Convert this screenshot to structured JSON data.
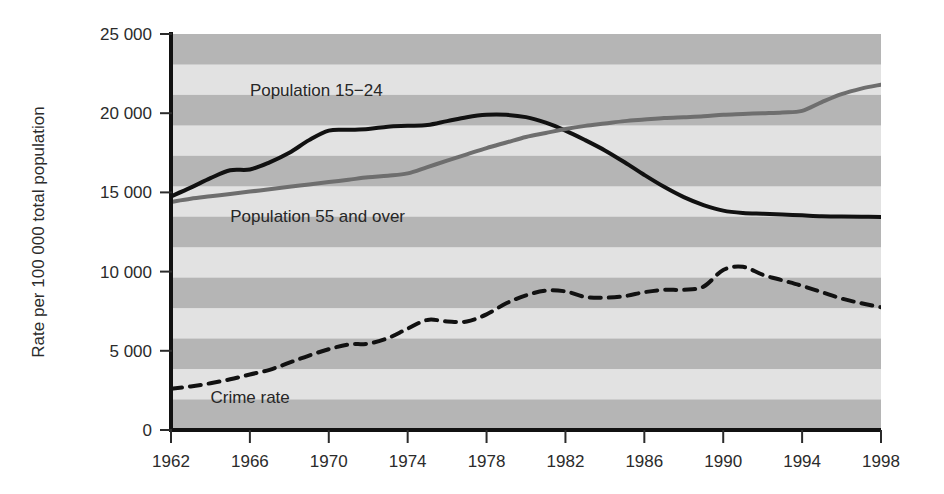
{
  "chart_data": {
    "type": "line",
    "title": "",
    "subtitle": "",
    "xlabel": "",
    "ylabel": "Rate per 100 000 total population",
    "xlim": [
      1962,
      1998
    ],
    "ylim": [
      0,
      25000
    ],
    "xticks": [
      1962,
      1966,
      1970,
      1974,
      1978,
      1982,
      1986,
      1990,
      1994,
      1998
    ],
    "xtick_labels": [
      "1962",
      "1966",
      "1970",
      "1974",
      "1978",
      "1982",
      "1986",
      "1990",
      "1994",
      "1998"
    ],
    "yticks": [
      0,
      5000,
      10000,
      15000,
      20000,
      25000
    ],
    "ytick_labels": [
      "0",
      "5 000",
      "10 000",
      "15 000",
      "20 000",
      "25 000"
    ],
    "grid": false,
    "banded_background": true,
    "band_colors": [
      "#b5b5b5",
      "#e2e2e2"
    ],
    "band_count": 13,
    "legend_position": "inline-annotations",
    "x": [
      1962,
      1963,
      1964,
      1965,
      1966,
      1967,
      1968,
      1969,
      1970,
      1971,
      1972,
      1973,
      1974,
      1975,
      1976,
      1977,
      1978,
      1979,
      1980,
      1981,
      1982,
      1983,
      1984,
      1985,
      1986,
      1987,
      1988,
      1989,
      1990,
      1991,
      1992,
      1993,
      1994,
      1995,
      1996,
      1997,
      1998
    ],
    "series": [
      {
        "name": "Population 15-24",
        "label": "Population 15−24",
        "color": "#111111",
        "style": "solid",
        "width": 4,
        "annotation_x": 1966,
        "annotation_y": 21100,
        "values": [
          14750,
          15300,
          15900,
          16400,
          16450,
          16900,
          17500,
          18300,
          18900,
          18950,
          19000,
          19150,
          19200,
          19250,
          19500,
          19750,
          19900,
          19900,
          19750,
          19400,
          18900,
          18300,
          17650,
          16900,
          16100,
          15350,
          14700,
          14200,
          13850,
          13700,
          13650,
          13600,
          13550,
          13500,
          13480,
          13460,
          13450
        ]
      },
      {
        "name": "Population 55 and over",
        "label": "Population 55 and over",
        "color": "#6e6e6e",
        "style": "solid",
        "width": 4,
        "annotation_x": 1965,
        "annotation_y": 13150,
        "values": [
          14400,
          14600,
          14750,
          14900,
          15050,
          15200,
          15350,
          15500,
          15650,
          15800,
          15950,
          16050,
          16200,
          16600,
          17000,
          17400,
          17800,
          18150,
          18500,
          18750,
          19000,
          19200,
          19350,
          19500,
          19600,
          19700,
          19750,
          19800,
          19900,
          19950,
          20000,
          20050,
          20150,
          20700,
          21200,
          21550,
          21800
        ]
      },
      {
        "name": "Crime rate",
        "label": "Crime rate",
        "color": "#111111",
        "style": "dashed",
        "width": 4,
        "annotation_x": 1964,
        "annotation_y": 1700,
        "values": [
          2600,
          2750,
          2950,
          3200,
          3500,
          3800,
          4250,
          4700,
          5100,
          5400,
          5450,
          5800,
          6400,
          6950,
          6850,
          6850,
          7300,
          8000,
          8500,
          8800,
          8750,
          8400,
          8350,
          8450,
          8700,
          8850,
          8850,
          9050,
          10100,
          10300,
          9800,
          9450,
          9100,
          8700,
          8300,
          8000,
          7750
        ]
      }
    ]
  },
  "axis": {
    "y_axis_name": "y-axis",
    "x_axis_name": "x-axis"
  }
}
